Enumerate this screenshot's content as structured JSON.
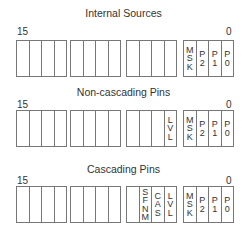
{
  "rows": [
    {
      "title": "Internal Sources",
      "high_bit": "15",
      "low_bit": "0",
      "groups": [
        [
          "",
          "",
          "",
          ""
        ],
        [
          "",
          "",
          "",
          ""
        ],
        [
          "",
          "",
          "",
          ""
        ],
        [
          "MSK",
          "P2",
          "P1",
          "P0"
        ]
      ]
    },
    {
      "title": "Non-cascading Pins",
      "high_bit": "15",
      "low_bit": "0",
      "groups": [
        [
          "",
          "",
          "",
          ""
        ],
        [
          "",
          "",
          "",
          ""
        ],
        [
          "",
          "",
          "",
          "LVL"
        ],
        [
          "MSK",
          "P2",
          "P1",
          "P0"
        ]
      ]
    },
    {
      "title": "Cascading Pins",
      "high_bit": "15",
      "low_bit": "0",
      "groups": [
        [
          "",
          "",
          "",
          ""
        ],
        [
          "",
          "",
          "",
          ""
        ],
        [
          "",
          "SFNM",
          "CAS",
          "LVL"
        ],
        [
          "MSK",
          "P2",
          "P1",
          "P0"
        ]
      ]
    }
  ],
  "colors": {
    "border": "#777777",
    "text": "#333333"
  }
}
